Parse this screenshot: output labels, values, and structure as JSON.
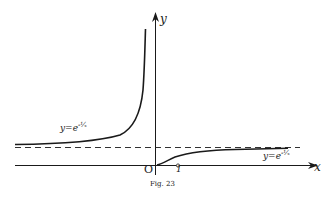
{
  "figure": {
    "caption": "Fig. 23",
    "axes": {
      "x_label": "x",
      "y_label": "y",
      "origin_label": "O",
      "tick_label_1": "1"
    },
    "curves": [
      {
        "name": "left-branch",
        "label_base": "y=e",
        "label_exp": "-1/x",
        "label_exp_display": "-¹⁄ₓ"
      },
      {
        "name": "right-branch",
        "label_base": "y=e",
        "label_exp": "-1/x",
        "label_exp_display": "-¹⁄ₓ"
      }
    ],
    "asymptote": "y = 1 (dashed)",
    "colors": {
      "ink": "#1a1a1a",
      "paper": "#ffffff"
    }
  }
}
